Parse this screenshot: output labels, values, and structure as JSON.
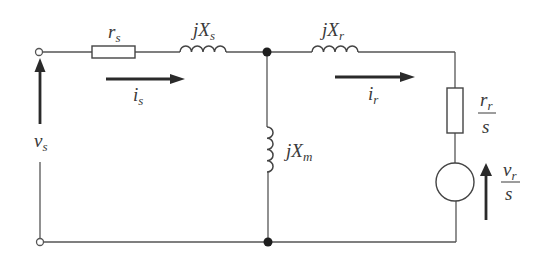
{
  "diagram": {
    "type": "equivalent-circuit",
    "title": "",
    "colors": {
      "line": "#555555",
      "text": "#3a3a3a",
      "node": "#1e1e1e",
      "background": "#ffffff"
    },
    "components": {
      "stator_resistance": {
        "base": "r",
        "sub": "s"
      },
      "stator_reactance": {
        "prefix": "j",
        "base": "X",
        "sub": "s"
      },
      "magnetizing_reactance": {
        "prefix": "j",
        "base": "X",
        "sub": "m"
      },
      "rotor_reactance": {
        "prefix": "j",
        "base": "X",
        "sub": "r"
      },
      "rotor_resistance": {
        "num_base": "r",
        "num_sub": "r",
        "den": "s"
      },
      "rotor_source": {
        "num_base": "v",
        "num_sub": "r",
        "den": "s"
      }
    },
    "currents": {
      "stator": {
        "base": "i",
        "sub": "s"
      },
      "rotor": {
        "base": "i",
        "sub": "r"
      }
    },
    "voltages": {
      "stator": {
        "base": "v",
        "sub": "s"
      }
    },
    "nodes": [
      {
        "id": "terminal-top",
        "kind": "open-terminal"
      },
      {
        "id": "terminal-bottom",
        "kind": "open-terminal"
      },
      {
        "id": "junction-top",
        "kind": "junction"
      },
      {
        "id": "junction-bottom",
        "kind": "junction"
      }
    ]
  }
}
